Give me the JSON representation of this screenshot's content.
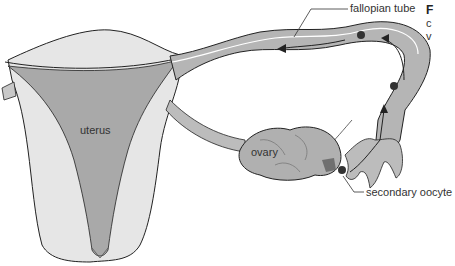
{
  "diagram": {
    "labels": {
      "fallopian_tube": "fallopian tube",
      "uterus": "uterus",
      "ovary": "ovary",
      "secondary_oocyte": "secondary oocyte"
    },
    "caption_fragment": {
      "line1": "F",
      "line2": "c",
      "line3": "v"
    },
    "colors": {
      "outer_tissue": "#e6e6e6",
      "inner_cavity": "#a9a9a9",
      "tube_fill": "#b5b5b5",
      "ovary_fill": "#b0b0b0",
      "outline": "#222222",
      "oocyte": "#333333",
      "text": "#333333"
    },
    "arrows": [
      {
        "description": "oocyte enters fimbriae, moving upward"
      },
      {
        "description": "oocyte travels through tube toward uterus"
      }
    ]
  }
}
